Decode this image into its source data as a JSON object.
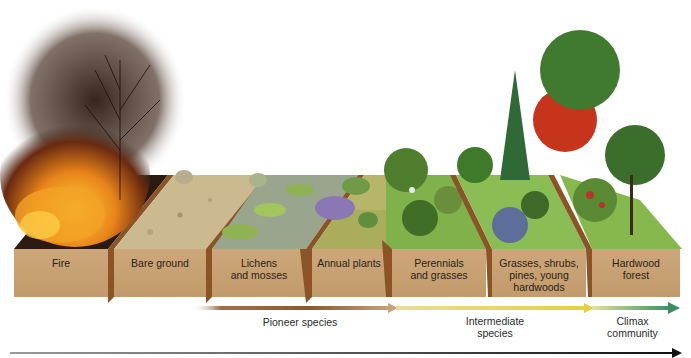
{
  "stages": [
    {
      "id": "fire",
      "label": "Fire"
    },
    {
      "id": "bare-ground",
      "label": "Bare ground"
    },
    {
      "id": "lichens-mosses",
      "label": "Lichens\nand mosses"
    },
    {
      "id": "annual-plants",
      "label": "Annual plants"
    },
    {
      "id": "perennials-grasses",
      "label": "Perennials\nand grasses"
    },
    {
      "id": "grasses-shrubs-pines",
      "label": "Grasses, shrubs,\npines, young\nhardwoods"
    },
    {
      "id": "hardwood-forest",
      "label": "Hardwood\nforest"
    }
  ],
  "phases": [
    {
      "id": "pioneer",
      "label": "Pioneer species",
      "color_start": "#c9a27a",
      "color_end": "#8a5a2e"
    },
    {
      "id": "intermediate",
      "label": "Intermediate\nspecies",
      "color_start": "#e7d36a",
      "color_end": "#e2d046"
    },
    {
      "id": "climax",
      "label": "Climax\ncommunity",
      "color_start": "#d9dc8a",
      "color_end": "#3f8f62"
    }
  ],
  "timeline": {
    "direction": "left-to-right",
    "color": "#1a1a1a"
  },
  "colors": {
    "block_face": "#c9a273",
    "block_side": "#8a5426",
    "soil_bare": "#cbb98f",
    "moss": "#8fb353",
    "grass": "#7fb24a",
    "fire_orange": "#e58a1c",
    "smoke": "#3a2a22",
    "autumn_red": "#c6341c"
  }
}
